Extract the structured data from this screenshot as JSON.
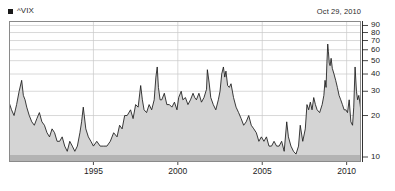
{
  "legend": {
    "label": "^VIX",
    "marker_icon": "square-marker-icon",
    "marker_color": "#1a1a1a"
  },
  "date_stamp": "Oct 29, 2010",
  "style": {
    "fill_color": "#d4d4d4",
    "line_color": "#1a1a1a",
    "grid_color": "#c8c8c8",
    "frame_color": "#8a8a8a",
    "band_color": "#b3b3b3",
    "background": "#ffffff"
  },
  "chart_data": {
    "type": "area",
    "title": "",
    "subtitle": "",
    "xlabel": "",
    "ylabel": "",
    "yscale": "log",
    "ylim": [
      9.2,
      97
    ],
    "xlim": [
      1990.0,
      2010.85
    ],
    "grid": true,
    "legend_position": "top-left",
    "ytick_values": [
      10,
      20,
      30,
      40,
      50,
      60,
      70,
      80,
      90
    ],
    "ytick_labels": [
      "10",
      "20",
      "30",
      "40",
      "50",
      "60",
      "70",
      "80",
      "90"
    ],
    "gridline_values": [
      20,
      30,
      40,
      50,
      60,
      70,
      80,
      90
    ],
    "xtick_values": [
      1995,
      2000,
      2005,
      2010
    ],
    "xtick_labels": [
      "1995",
      "2000",
      "2005",
      "2010"
    ],
    "series": [
      {
        "name": "^VIX",
        "x": [
          1990.0,
          1990.15,
          1990.3,
          1990.45,
          1990.6,
          1990.75,
          1990.85,
          1990.95,
          1991.05,
          1991.2,
          1991.35,
          1991.5,
          1991.65,
          1991.8,
          1991.95,
          1992.1,
          1992.25,
          1992.4,
          1992.55,
          1992.7,
          1992.85,
          1993.0,
          1993.15,
          1993.3,
          1993.45,
          1993.6,
          1993.75,
          1993.9,
          1994.05,
          1994.2,
          1994.3,
          1994.4,
          1994.55,
          1994.7,
          1994.85,
          1995.0,
          1995.2,
          1995.4,
          1995.6,
          1995.8,
          1996.0,
          1996.2,
          1996.4,
          1996.55,
          1996.7,
          1996.85,
          1997.0,
          1997.2,
          1997.35,
          1997.5,
          1997.65,
          1997.8,
          1997.9,
          1998.0,
          1998.15,
          1998.3,
          1998.45,
          1998.6,
          1998.7,
          1998.78,
          1998.85,
          1998.95,
          1999.05,
          1999.2,
          1999.35,
          1999.5,
          1999.65,
          1999.8,
          1999.95,
          2000.05,
          2000.2,
          2000.3,
          2000.45,
          2000.6,
          2000.75,
          2000.9,
          2001.0,
          2001.1,
          2001.25,
          2001.4,
          2001.55,
          2001.7,
          2001.75,
          2001.85,
          2001.95,
          2002.1,
          2002.25,
          2002.4,
          2002.5,
          2002.6,
          2002.7,
          2002.78,
          2002.85,
          2002.95,
          2003.05,
          2003.15,
          2003.3,
          2003.45,
          2003.6,
          2003.75,
          2003.9,
          2004.05,
          2004.2,
          2004.35,
          2004.5,
          2004.65,
          2004.8,
          2004.95,
          2005.1,
          2005.25,
          2005.4,
          2005.55,
          2005.7,
          2005.85,
          2006.0,
          2006.15,
          2006.3,
          2006.45,
          2006.55,
          2006.7,
          2006.85,
          2007.0,
          2007.15,
          2007.25,
          2007.4,
          2007.55,
          2007.65,
          2007.75,
          2007.85,
          2007.95,
          2008.05,
          2008.15,
          2008.25,
          2008.4,
          2008.55,
          2008.65,
          2008.72,
          2008.78,
          2008.83,
          2008.88,
          2008.92,
          2008.97,
          2009.02,
          2009.08,
          2009.15,
          2009.25,
          2009.35,
          2009.45,
          2009.55,
          2009.65,
          2009.75,
          2009.85,
          2009.95,
          2010.05,
          2010.15,
          2010.25,
          2010.35,
          2010.42,
          2010.5,
          2010.58,
          2010.65,
          2010.72,
          2010.8,
          2010.85
        ],
        "values": [
          25,
          22,
          20,
          24,
          30,
          36,
          28,
          26,
          23,
          20,
          18,
          17,
          19,
          21,
          18,
          17,
          15,
          14,
          16,
          15,
          13,
          13,
          14,
          12,
          11,
          13,
          12,
          11,
          12,
          15,
          18,
          23,
          16,
          14,
          13,
          12,
          13,
          12,
          12,
          12,
          13,
          15,
          14,
          17,
          16,
          20,
          20,
          22,
          19,
          24,
          23,
          33,
          26,
          22,
          21,
          24,
          22,
          26,
          38,
          45,
          32,
          26,
          26,
          29,
          24,
          24,
          23,
          25,
          22,
          27,
          30,
          26,
          27,
          24,
          26,
          29,
          27,
          26,
          29,
          25,
          27,
          31,
          43,
          35,
          27,
          24,
          22,
          26,
          30,
          40,
          45,
          38,
          42,
          33,
          32,
          34,
          27,
          23,
          21,
          19,
          17,
          18,
          20,
          17,
          16,
          15,
          13,
          14,
          13,
          14,
          12,
          12,
          13,
          12,
          12,
          13,
          11,
          18,
          14,
          12,
          11,
          10.5,
          12,
          17,
          13,
          16,
          24,
          22,
          25,
          22,
          27,
          24,
          22,
          21,
          24,
          28,
          36,
          32,
          48,
          66,
          58,
          48,
          46,
          52,
          44,
          40,
          36,
          32,
          28,
          26,
          24,
          22,
          22,
          21,
          26,
          18,
          17,
          23,
          45,
          30,
          26,
          28,
          24,
          21
        ]
      }
    ]
  }
}
